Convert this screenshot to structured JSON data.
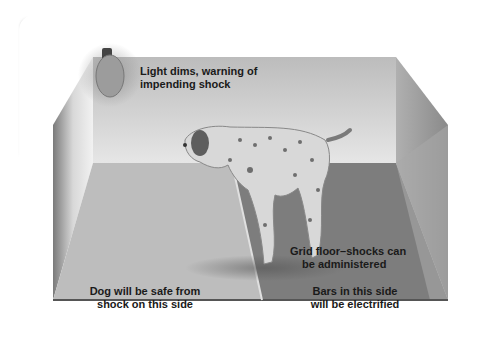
{
  "diagram": {
    "labels": {
      "light_warning": [
        "Light dims, warning of",
        "impending shock"
      ],
      "grid_floor": [
        "Grid floor–shocks can",
        "be administered"
      ],
      "safe_side": [
        "Dog will be safe from",
        "shock on this side"
      ],
      "electrified_side": [
        "Bars in this side",
        "will be electrified"
      ]
    },
    "elements": [
      "light bulb",
      "dog",
      "safe floor",
      "grid floor",
      "barrier"
    ],
    "colors": {
      "card_bg": "#ffffff",
      "card_shadow": "#9a9a9a",
      "back_wall": "#c9c9c9",
      "side_wall": "#8f8f8f",
      "safe_floor": "#bdbdbd",
      "grid_floor": "#7d7d7d",
      "floor_edge": "#555555",
      "dog_body": "#d8d8d8",
      "dog_spots": "#6e6e6e"
    }
  }
}
